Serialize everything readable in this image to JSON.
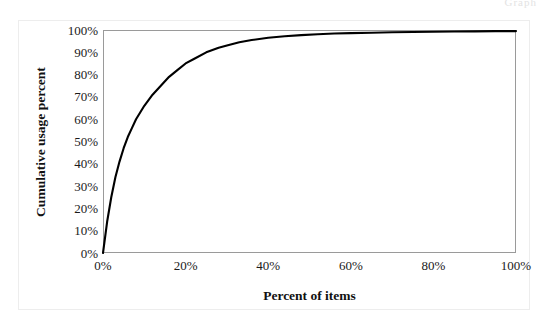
{
  "figure": {
    "header_artifact": "Graph",
    "background_color": "#ffffff",
    "frame_color": "#ededed",
    "plot_border_color": "#9a9a9a",
    "curve_color": "#000000"
  },
  "chart_data": {
    "type": "line",
    "title": "",
    "subtitle": "",
    "xlabel": "Percent of items",
    "ylabel": "Cumulative usage percent",
    "xlim": [
      0,
      100
    ],
    "ylim": [
      0,
      100
    ],
    "grid": false,
    "legend": null,
    "legend_position": "none",
    "xtick_labels": [
      "0%",
      "20%",
      "40%",
      "60%",
      "80%",
      "100%"
    ],
    "xtick_values": [
      0,
      20,
      40,
      60,
      80,
      100
    ],
    "ytick_labels": [
      "100%",
      "90%",
      "80%",
      "70%",
      "60%",
      "50%",
      "40%",
      "30%",
      "20%",
      "10%",
      "0%"
    ],
    "ytick_values": [
      100,
      90,
      80,
      70,
      60,
      50,
      40,
      30,
      20,
      10,
      0
    ],
    "series": [
      {
        "name": "Cumulative usage",
        "color": "#000000",
        "x": [
          0,
          1,
          2,
          3,
          4,
          5,
          6,
          7,
          8,
          9,
          10,
          12,
          14,
          16,
          18,
          20,
          22,
          25,
          28,
          30,
          33,
          36,
          40,
          44,
          48,
          52,
          56,
          60,
          65,
          70,
          75,
          80,
          85,
          90,
          95,
          100
        ],
        "y": [
          0,
          14,
          25,
          34,
          41,
          47,
          52,
          56,
          60,
          63,
          66,
          71,
          75,
          79,
          82,
          85,
          87,
          90,
          92,
          93,
          94.5,
          95.5,
          96.5,
          97.2,
          97.7,
          98.1,
          98.4,
          98.6,
          98.8,
          99,
          99.1,
          99.2,
          99.3,
          99.4,
          99.5,
          99.5
        ]
      }
    ],
    "annotations": []
  }
}
